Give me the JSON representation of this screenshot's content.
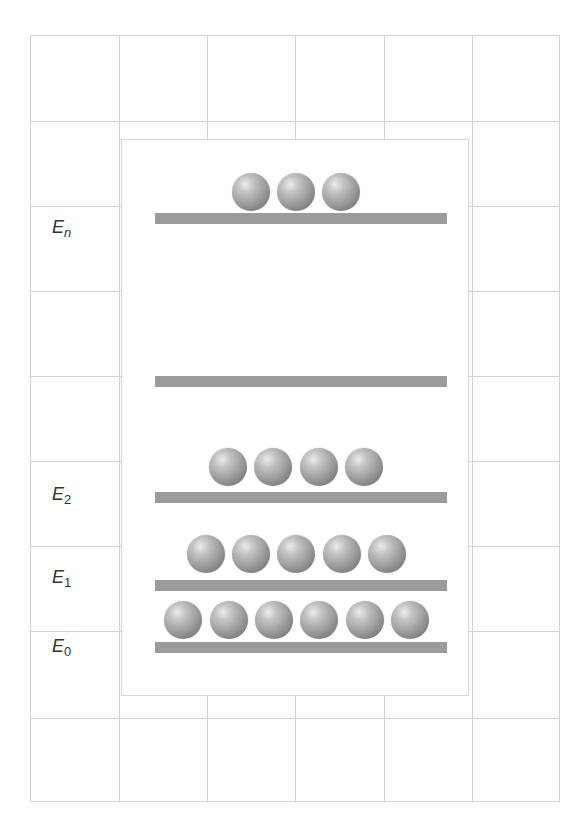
{
  "diagram": {
    "title": "",
    "colors": {
      "grid_line": "#d2d2d2",
      "panel_border": "#d6d6d6",
      "bar": "#9b9b9b",
      "ball_highlight": "#ececec",
      "ball_shadow": "#5f5f5f",
      "label": "#333333"
    },
    "grid": {
      "columns": 6,
      "rows": 9
    },
    "levels": [
      {
        "id": "En",
        "label_main": "E",
        "label_sub": "n",
        "particles": 3
      },
      {
        "id": "dots",
        "label_main": "",
        "label_sub": "",
        "particles": 0
      },
      {
        "id": "E2",
        "label_main": "E",
        "label_sub": "2",
        "particles": 4
      },
      {
        "id": "E1",
        "label_main": "E",
        "label_sub": "1",
        "particles": 5
      },
      {
        "id": "E0",
        "label_main": "E",
        "label_sub": "0",
        "particles": 6
      }
    ]
  }
}
